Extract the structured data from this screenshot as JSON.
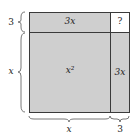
{
  "diagram": {
    "cells": {
      "top_left": {
        "label": "3x",
        "color": "#cfcfcf"
      },
      "top_right": {
        "label": "?",
        "color": "#ffffff"
      },
      "bottom_left": {
        "label": "x²",
        "color": "#cfcfcf"
      },
      "bottom_right": {
        "label": "3x",
        "color": "#cfcfcf"
      }
    },
    "dimensions": {
      "left_top": "3",
      "left_bottom": "x",
      "bottom_left": "x",
      "bottom_right": "3"
    }
  }
}
